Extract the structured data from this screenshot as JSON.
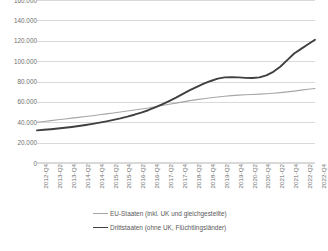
{
  "chart_data": {
    "type": "line",
    "title": "",
    "xlabel": "",
    "ylabel": "",
    "ylim": [
      0,
      160000
    ],
    "yticks": [
      0,
      20000,
      40000,
      60000,
      80000,
      100000,
      120000,
      140000,
      160000
    ],
    "ytick_labels": [
      "0",
      "20.000",
      "40.000",
      "60.000",
      "80.000",
      "100.000",
      "120.000",
      "140.000",
      "160.000"
    ],
    "grid": true,
    "legend_position": "bottom",
    "number_format": "de-DE (period as thousands separator)",
    "x": [
      "2012-Q4",
      "2013-Q1",
      "2013-Q2",
      "2013-Q3",
      "2013-Q4",
      "2014-Q1",
      "2014-Q2",
      "2014-Q3",
      "2014-Q4",
      "2015-Q1",
      "2015-Q2",
      "2015-Q3",
      "2015-Q4",
      "2016-Q1",
      "2016-Q2",
      "2016-Q3",
      "2016-Q4",
      "2017-Q1",
      "2017-Q2",
      "2017-Q3",
      "2017-Q4",
      "2018-Q1",
      "2018-Q2",
      "2018-Q3",
      "2018-Q4",
      "2019-Q1",
      "2019-Q2",
      "2019-Q3",
      "2019-Q4",
      "2020-Q1",
      "2020-Q2",
      "2020-Q3",
      "2020-Q4",
      "2021-Q1",
      "2021-Q2",
      "2021-Q3",
      "2021-Q4",
      "2022-Q1",
      "2022-Q2",
      "2022-Q3",
      "2022-Q4"
    ],
    "xtick_labels": [
      "2012-Q4",
      "2013-Q2",
      "2013-Q4",
      "2014-Q2",
      "2014-Q4",
      "2015-Q2",
      "2015-Q4",
      "2016-Q2",
      "2016-Q4",
      "2017-Q2",
      "2017-Q4",
      "2018-Q2",
      "2018-Q4",
      "2019-Q2",
      "2019-Q4",
      "2020-Q2",
      "2020-Q4",
      "2021-Q2",
      "2021-Q4",
      "2022-Q2",
      "2022-Q4"
    ],
    "series": [
      {
        "name": "EU-Staaten (inkl. UK und gleichgestellte)",
        "color": "#a6a6a6",
        "width": 1.1,
        "values": [
          40000,
          40800,
          41600,
          42400,
          43200,
          44000,
          44800,
          45600,
          46400,
          47300,
          48200,
          49100,
          50000,
          51000,
          52000,
          53000,
          54000,
          55200,
          56400,
          57600,
          58800,
          60000,
          61200,
          62200,
          63100,
          64000,
          64800,
          65500,
          66100,
          66600,
          67000,
          67300,
          67600,
          68000,
          68500,
          69100,
          69800,
          70600,
          71500,
          72400,
          73200
        ]
      },
      {
        "name": "Drittstaaten (ohne UK, Flüchtlingsländer)",
        "color": "#404040",
        "width": 1.9,
        "values": [
          32000,
          32600,
          33200,
          33900,
          34600,
          35400,
          36300,
          37300,
          38400,
          39600,
          40900,
          42300,
          43800,
          45500,
          47400,
          49500,
          51800,
          54500,
          57500,
          60800,
          64200,
          67800,
          71500,
          74800,
          77800,
          80500,
          82800,
          84000,
          84300,
          84000,
          83600,
          83500,
          84000,
          86000,
          89500,
          94500,
          101000,
          107500,
          112000,
          116500,
          121000
        ]
      }
    ]
  },
  "legend": {
    "entries": [
      {
        "label": "EU-Staaten (inkl. UK und gleichgestellte)",
        "swatch": "eu"
      },
      {
        "label": "Drittstaaten (ohne UK, Flüchtlingsländer)",
        "swatch": "drittstaaten"
      }
    ]
  }
}
